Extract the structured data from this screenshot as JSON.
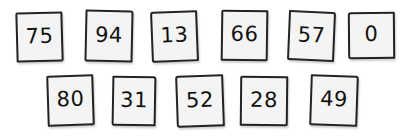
{
  "canvas": {
    "width": 408,
    "height": 138,
    "background_color": "#ffffff"
  },
  "style": {
    "tile_fill": "#f4f4f4",
    "tile_border": "#232323",
    "digit_color": "#111111"
  },
  "rows": [
    {
      "name": "top-row",
      "tiles": [
        {
          "value": "75",
          "x": 16,
          "y": 12,
          "w": 47,
          "h": 50,
          "rot": -1.6
        },
        {
          "value": "94",
          "x": 85,
          "y": 10,
          "w": 48,
          "h": 52,
          "rot": 1.2
        },
        {
          "value": "13",
          "x": 151,
          "y": 11,
          "w": 47,
          "h": 51,
          "rot": -2.2
        },
        {
          "value": "66",
          "x": 221,
          "y": 10,
          "w": 47,
          "h": 51,
          "rot": 0.8
        },
        {
          "value": "57",
          "x": 288,
          "y": 11,
          "w": 47,
          "h": 50,
          "rot": 2.4
        },
        {
          "value": "0",
          "x": 348,
          "y": 12,
          "w": 47,
          "h": 47,
          "rot": -0.5
        }
      ]
    },
    {
      "name": "bottom-row",
      "tiles": [
        {
          "value": "80",
          "x": 47,
          "y": 75,
          "w": 47,
          "h": 51,
          "rot": -1.8
        },
        {
          "value": "31",
          "x": 112,
          "y": 76,
          "w": 44,
          "h": 50,
          "rot": 1.0
        },
        {
          "value": "52",
          "x": 176,
          "y": 75,
          "w": 48,
          "h": 52,
          "rot": -2.0
        },
        {
          "value": "28",
          "x": 240,
          "y": 76,
          "w": 48,
          "h": 50,
          "rot": 0.6
        },
        {
          "value": "49",
          "x": 310,
          "y": 75,
          "w": 48,
          "h": 51,
          "rot": 1.9
        }
      ]
    }
  ]
}
